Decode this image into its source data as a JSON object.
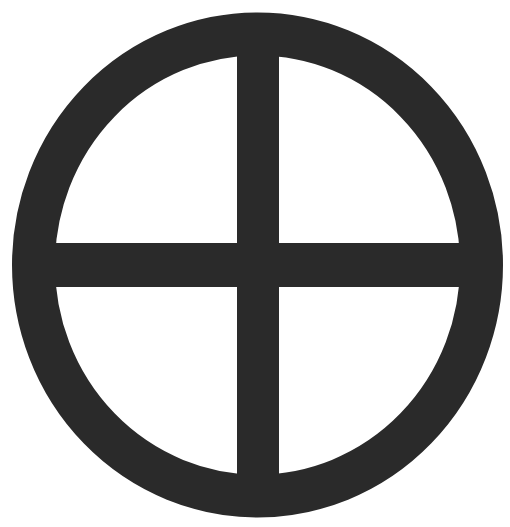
{
  "symbol": {
    "name": "sun-cross",
    "description": "Circled cross symbol",
    "fill_color": "#2a2a2a",
    "background_color": "#ffffff"
  }
}
